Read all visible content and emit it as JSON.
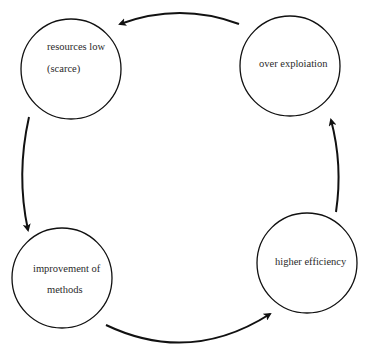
{
  "diagram": {
    "type": "cycle",
    "direction": "counter-clockwise",
    "colors": {
      "stroke": "#111111",
      "text": "#2a2a2a",
      "background": "#ffffff"
    },
    "nodes": [
      {
        "id": "resources-low",
        "line1": "resources low",
        "line2": "(scarce)"
      },
      {
        "id": "over-exploitation",
        "line1": "over exploiation"
      },
      {
        "id": "improvement-of-methods",
        "line1": "improvement of",
        "line2": "methods"
      },
      {
        "id": "higher-efficiency",
        "line1": "higher efficiency"
      }
    ],
    "edges": [
      {
        "from": "over-exploitation",
        "to": "resources-low"
      },
      {
        "from": "resources-low",
        "to": "improvement-of-methods"
      },
      {
        "from": "improvement-of-methods",
        "to": "higher-efficiency"
      },
      {
        "from": "higher-efficiency",
        "to": "over-exploitation"
      }
    ]
  }
}
